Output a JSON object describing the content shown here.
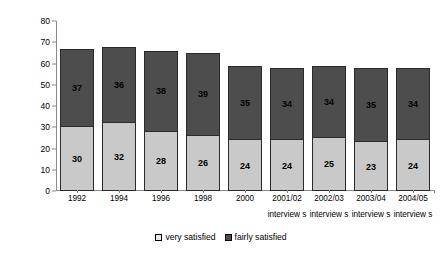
{
  "chart_data": {
    "type": "bar",
    "subtype": "stacked-bar",
    "title": "",
    "xlabel": "",
    "ylabel": "Percentage very or fairly satisfied",
    "ylim": [
      0,
      80
    ],
    "yticks": [
      0,
      10,
      20,
      30,
      40,
      50,
      60,
      70,
      80
    ],
    "grid": false,
    "legend_position": "bottom-center",
    "categories": [
      "1992",
      "1994",
      "1996",
      "1998",
      "2000",
      "2001/02",
      "2002/03",
      "2003/04",
      "2004/05"
    ],
    "category_sublabels": [
      "",
      "",
      "",
      "",
      "",
      "interview s",
      "interview s",
      "interview s",
      "interview s"
    ],
    "series": [
      {
        "name": "very satisfied",
        "color": "#c9c9c9",
        "values": [
          30,
          32,
          28,
          26,
          24,
          24,
          25,
          23,
          24
        ]
      },
      {
        "name": "fairly satisfied",
        "color": "#4d4d4d",
        "values": [
          37,
          36,
          38,
          39,
          35,
          34,
          34,
          35,
          34
        ]
      }
    ],
    "totals": [
      67,
      68,
      66,
      65,
      59,
      58,
      59,
      58,
      58
    ]
  },
  "axis": {
    "y_title": "Percentage very or fairly satisfied",
    "y_tick_labels": [
      "0",
      "10",
      "20",
      "30",
      "40",
      "50",
      "60",
      "70",
      "80"
    ]
  },
  "legend": {
    "items": [
      {
        "label": "very satisfied",
        "swatch": "legend-swatch-very-satisfied"
      },
      {
        "label": "fairly satisfied",
        "swatch": "legend-swatch-fairly-satisfied"
      }
    ]
  },
  "colors": {
    "very_satisfied": "#c9c9c9",
    "fairly_satisfied": "#4d4d4d",
    "axis": "#8a8a8a",
    "text": "#000000",
    "background": "#ffffff"
  }
}
